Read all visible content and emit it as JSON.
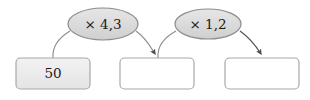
{
  "diagram": {
    "type": "multiplication-chain-flowchart",
    "background_color": "#ffffff",
    "operators": [
      {
        "id": "op1",
        "label": "× 4,3",
        "multiplier": 4.3,
        "fill_color": "#dcdcdc",
        "stroke_color": "#8c8c8c",
        "cx": 103,
        "cy": 24,
        "rx": 35,
        "ry": 16
      },
      {
        "id": "op2",
        "label": "× 1,2",
        "multiplier": 1.2,
        "fill_color": "#dcdcdc",
        "stroke_color": "#8c8c8c",
        "cx": 208,
        "cy": 24,
        "rx": 33,
        "ry": 15
      }
    ],
    "boxes": [
      {
        "id": "box1",
        "label": "50",
        "value": "50",
        "filled": true,
        "fill_color": "#ececed",
        "stroke_color": "#a8a8a8",
        "x": 16,
        "y": 58,
        "width": 74,
        "height": 31
      },
      {
        "id": "box2",
        "label": "",
        "value": "",
        "filled": false,
        "fill_color": "#ffffff",
        "stroke_color": "#a8a8a8",
        "x": 120,
        "y": 58,
        "width": 74,
        "height": 31
      },
      {
        "id": "box3",
        "label": "",
        "value": "",
        "filled": false,
        "fill_color": "#ffffff",
        "stroke_color": "#a8a8a8",
        "x": 225,
        "y": 58,
        "width": 74,
        "height": 31
      }
    ],
    "connectors": [
      {
        "id": "conn1",
        "from": "box1",
        "to": "op1",
        "has_arrowhead": false,
        "stroke_color": "#8c8c8c",
        "path": "M 53 58 C 52 46 60 37 70 31"
      },
      {
        "id": "conn2",
        "from": "op1",
        "to": "box2",
        "has_arrowhead": true,
        "stroke_color": "#8c8c8c",
        "arrow_color": "#4d4d4d",
        "path": "M 136 31 C 146 38 150 46 155 54"
      },
      {
        "id": "conn3",
        "from": "box2",
        "to": "op2",
        "has_arrowhead": false,
        "stroke_color": "#8c8c8c",
        "path": "M 158 58 C 157 46 165 37 176 31"
      },
      {
        "id": "conn4",
        "from": "op2",
        "to": "box3",
        "has_arrowhead": true,
        "stroke_color": "#4d4d4d",
        "arrow_color": "#4d4d4d",
        "path": "M 240 31 C 250 38 256 46 261 54"
      }
    ]
  }
}
